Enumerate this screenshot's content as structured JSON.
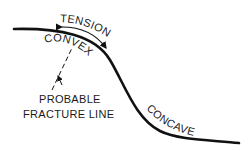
{
  "diagram": {
    "labels": {
      "tension": "TENSION",
      "convex": "CONVEX",
      "fracture_line_1": "PROBABLE",
      "fracture_line_2": "FRACTURE LINE",
      "concave": "CONCAVE"
    },
    "colors": {
      "line": "#111111",
      "background": "#ffffff"
    }
  }
}
